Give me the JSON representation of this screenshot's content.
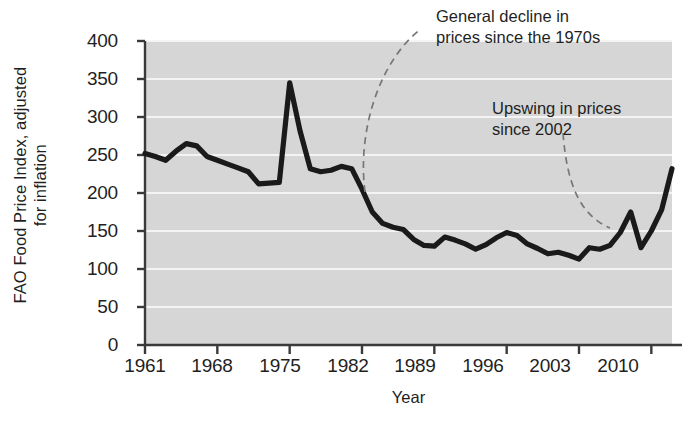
{
  "axes": {
    "ylabel_line1": "FAO Food Price Index, adjusted",
    "ylabel_line2": "for inflation",
    "xlabel": "Year",
    "yticks": [
      "400",
      "350",
      "300",
      "250",
      "200",
      "150",
      "100",
      "50",
      "0"
    ],
    "xticks": [
      "1961",
      "1968",
      "1975",
      "1982",
      "1989",
      "1996",
      "2003",
      "2010"
    ]
  },
  "annotations": {
    "decline": {
      "line1": "General decline in",
      "line2": "prices since the 1970s"
    },
    "upswing": {
      "line1": "Upswing in prices",
      "line2": "since 2002"
    }
  },
  "colors": {
    "plot_background": "#d6d6d6",
    "gridline": "#f4f4f4",
    "line": "#1a1a1a",
    "axis": "#3a3a3a",
    "text": "#1f1f1f"
  },
  "chart_data": {
    "type": "line",
    "title": "",
    "xlabel": "Year",
    "ylabel": "FAO Food Price Index, adjusted for inflation",
    "xlim": [
      1961,
      2012
    ],
    "ylim": [
      0,
      400
    ],
    "ytick_step": 50,
    "xtick_step": 7,
    "grid": "horizontal",
    "legend": "none",
    "x": [
      1961,
      1962,
      1963,
      1964,
      1965,
      1966,
      1967,
      1968,
      1969,
      1970,
      1971,
      1972,
      1973,
      1974,
      1975,
      1976,
      1977,
      1978,
      1979,
      1980,
      1981,
      1982,
      1983,
      1984,
      1985,
      1986,
      1987,
      1988,
      1989,
      1990,
      1991,
      1992,
      1993,
      1994,
      1995,
      1996,
      1997,
      1998,
      1999,
      2000,
      2001,
      2002,
      2003,
      2004,
      2005,
      2006,
      2007,
      2008,
      2009,
      2010,
      2011,
      2012
    ],
    "values": [
      252,
      248,
      243,
      255,
      265,
      262,
      248,
      243,
      238,
      233,
      228,
      212,
      213,
      214,
      345,
      282,
      232,
      228,
      230,
      235,
      232,
      205,
      175,
      160,
      155,
      152,
      139,
      131,
      130,
      142,
      138,
      133,
      126,
      132,
      141,
      148,
      144,
      133,
      127,
      120,
      122,
      118,
      113,
      128,
      126,
      131,
      148,
      175,
      128,
      150,
      178,
      232
    ],
    "annotations": [
      {
        "text": "General decline in prices since the 1970s",
        "leader_from_year": 1982,
        "leader_from_value": 170
      },
      {
        "text": "Upswing in prices since 2002",
        "leader_from_year": 2003,
        "leader_from_value": 115
      }
    ]
  }
}
